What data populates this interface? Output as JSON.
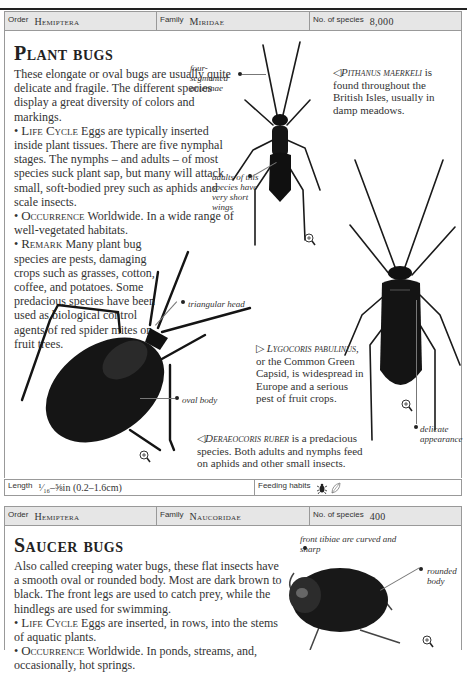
{
  "plant_bugs": {
    "header": {
      "order_label": "Order",
      "order_value": "Hemiptera",
      "family_label": "Family",
      "family_value": "Miridae",
      "species_label": "No. of species",
      "species_value": "8,000"
    },
    "title": "Plant bugs",
    "intro": "These elongate or oval bugs are usually quite delicate and fragile. The different species display a great diversity of colors and markings.",
    "sections": [
      {
        "heading": "Life Cycle",
        "text": "Eggs are typically inserted inside plant tissues. There are five nymphal stages. The nymphs – and adults – of most species suck plant sap, but many will attack small, soft-bodied prey such as aphids and scale insects."
      },
      {
        "heading": "Occurrence",
        "text": "Worldwide. In a wide range of well-vegetated habitats."
      },
      {
        "heading": "Remark",
        "text": "Many plant bug species are pests, damaging crops such as grasses, cotton, coffee, and potatoes. Some predacious species have been used as biological control agents of red spider mites on fruit trees."
      }
    ],
    "annotations": {
      "antennae": "four-segmented antennae",
      "short_wings": "adults of this species have very short wings",
      "triangular_head": "triangular head",
      "oval_body": "oval body",
      "delicate": "delicate appearance"
    },
    "captions": {
      "pithanus_species": "Pithanus maerkeli",
      "pithanus_text": "is found throughout the British Isles, usually in damp meadows.",
      "lygocoris_species": "Lygocoris pabulinus,",
      "lygocoris_text": "or the Common Green Capsid, is widespread in Europe and a serious pest of fruit crops.",
      "deraeocoris_species": "Deraeocoris ruber",
      "deraeocoris_text": "is a predacious species. Both adults and nymphs feed on aphids and other small insects."
    },
    "footer": {
      "length_label": "Length",
      "length_value": "¹⁄₁₆–⅝in (0.2–1.6cm)",
      "feeding_label": "Feeding habits",
      "feeding_icons": [
        "predator-bug-icon",
        "plant-leaf-icon"
      ]
    }
  },
  "saucer_bugs": {
    "header": {
      "order_label": "Order",
      "order_value": "Hemiptera",
      "family_label": "Family",
      "family_value": "Naucoridae",
      "species_label": "No. of species",
      "species_value": "400"
    },
    "title": "Saucer bugs",
    "intro": "Also called creeping water bugs, these flat insects have a smooth oval or rounded body. Most are dark brown to black. The front legs are used to catch prey, while the hindlegs are used for swimming.",
    "sections": [
      {
        "heading": "Life Cycle",
        "text": "Eggs are inserted, in rows, into the stems of aquatic plants."
      },
      {
        "heading": "Occurrence",
        "text": "Worldwide. In ponds, streams, and, occasionally, hot springs."
      }
    ],
    "annotations": {
      "front_tibiae": "front tibiae are curved and sharp",
      "rounded_body": "rounded body"
    }
  },
  "symbols": {
    "bullet": "•",
    "arrow_left": "◁",
    "arrow_right": "▷"
  }
}
